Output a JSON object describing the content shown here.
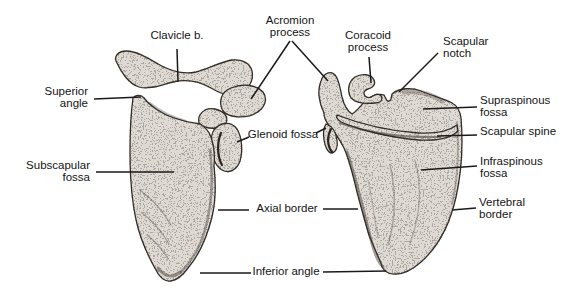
{
  "labels": {
    "clavicle_b": "Clavicle b.",
    "acromion_process": {
      "l1": "Acromion",
      "l2": "process"
    },
    "coracoid_process": {
      "l1": "Coracoid",
      "l2": "process"
    },
    "scapular_notch": {
      "l1": "Scapular",
      "l2": "notch"
    },
    "superior_angle": {
      "l1": "Superior",
      "l2": "angle"
    },
    "subscapular_fossa": {
      "l1": "Subscapular",
      "l2": "fossa"
    },
    "glenoid_fossa": "Glenoid fossa",
    "supraspinous_fossa": {
      "l1": "Supraspinous",
      "l2": "fossa"
    },
    "scapular_spine": "Scapular spine",
    "infraspinous_fossa": {
      "l1": "Infraspinous",
      "l2": "fossa"
    },
    "vertebral_border": {
      "l1": "Vertebral",
      "l2": "border"
    },
    "axial_border": "Axial border",
    "inferior_angle": "Inferior angle"
  },
  "colors": {
    "background": "#ffffff",
    "ink": "#141414",
    "leader_line": "#1a1a1a",
    "bone_fill": "#ded9d2",
    "bone_outline": "#352f29"
  }
}
